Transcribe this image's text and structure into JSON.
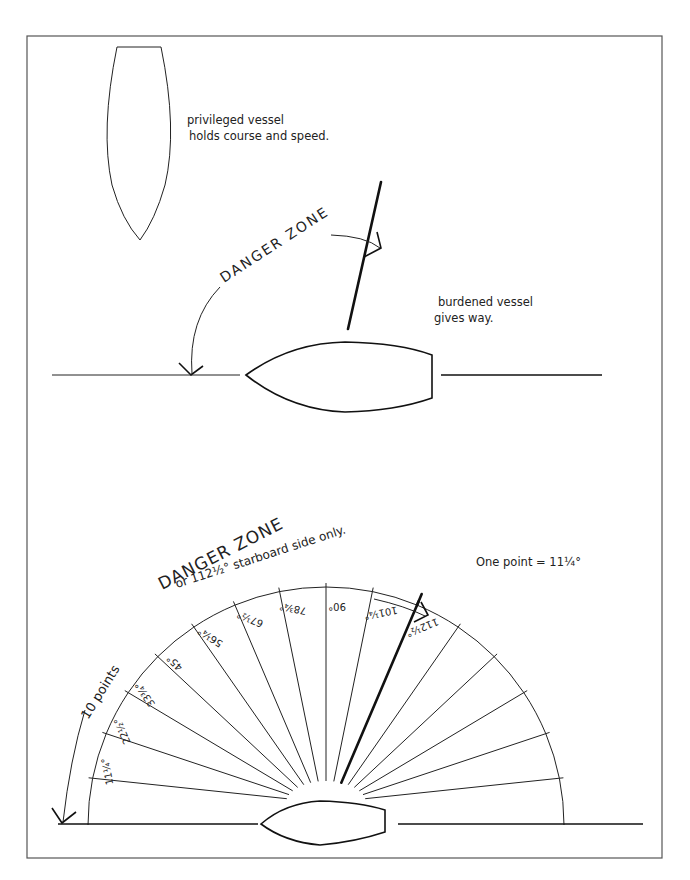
{
  "figure": {
    "top_diagram": {
      "privileged_label_line1": "privileged vessel",
      "privileged_label_line2": "holds course and speed.",
      "danger_zone_label": "DANGER   ZONE",
      "burdened_label_line1": "burdened vessel",
      "burdened_label_line2": "gives way."
    },
    "bottom_diagram": {
      "title": "DANGER ZONE",
      "subtitle_left": "10 points",
      "subtitle_right": "or 112½° starboard side only.",
      "note": "One point = 11¼°",
      "points_total": 16,
      "danger_points": 10,
      "degrees_per_point": 11.25,
      "bearing_labels": [
        "11¼°",
        "22½°",
        "33¾°",
        "45°",
        "56¼°",
        "67½°",
        "78¾°",
        "90°",
        "101¼°",
        "112½°"
      ]
    }
  }
}
